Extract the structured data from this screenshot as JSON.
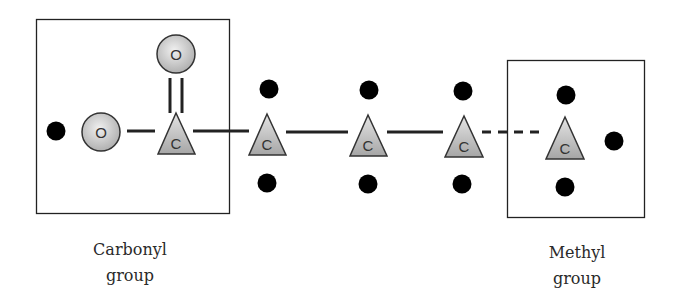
{
  "diagram": {
    "type": "fatty-acid-chain-schematic",
    "groups": [
      {
        "id": "carbonyl",
        "label_line1": "Carbonyl",
        "label_line2": "group"
      },
      {
        "id": "methyl",
        "label_line1": "Methyl",
        "label_line2": "group"
      }
    ],
    "atoms": [
      {
        "id": "o_double",
        "symbol": "O",
        "shape": "circle"
      },
      {
        "id": "o_single",
        "symbol": "O",
        "shape": "circle"
      },
      {
        "id": "c1",
        "symbol": "C",
        "shape": "triangle"
      },
      {
        "id": "c2",
        "symbol": "C",
        "shape": "triangle"
      },
      {
        "id": "c3",
        "symbol": "C",
        "shape": "triangle"
      },
      {
        "id": "c4",
        "symbol": "C",
        "shape": "triangle"
      },
      {
        "id": "c5",
        "symbol": "C",
        "shape": "triangle"
      }
    ],
    "hydrogen_dot_count": 10,
    "bonds": [
      {
        "from": "o_double",
        "to": "c1",
        "style": "double"
      },
      {
        "from": "o_single",
        "to": "c1",
        "style": "single"
      },
      {
        "from": "c1",
        "to": "c2",
        "style": "single"
      },
      {
        "from": "c2",
        "to": "c3",
        "style": "single"
      },
      {
        "from": "c3",
        "to": "c4",
        "style": "single"
      },
      {
        "from": "c4",
        "to": "c5",
        "style": "dashed"
      }
    ],
    "colors": {
      "atom_fill_light": "#eaeaea",
      "atom_fill_dark": "#a8a8a8",
      "stroke": "#222222",
      "dot": "#000000"
    }
  }
}
